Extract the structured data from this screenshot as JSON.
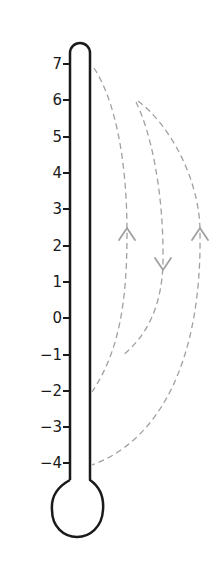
{
  "diagram": {
    "type": "thermometer",
    "scale": {
      "ticks": [
        "7",
        "6",
        "5",
        "4",
        "3",
        "2",
        "1",
        "0",
        "−1",
        "−2",
        "−3",
        "−4"
      ],
      "values": [
        7,
        6,
        5,
        4,
        3,
        2,
        1,
        0,
        -1,
        -2,
        -3,
        -4
      ]
    },
    "arrows": [
      {
        "name": "arc-7-to-minus2",
        "from": 7,
        "to": -2,
        "arrow_direction": "up",
        "style": "dashed"
      },
      {
        "name": "arc-inner-down",
        "from": 6,
        "to": -1,
        "arrow_direction": "down",
        "style": "dashed"
      },
      {
        "name": "arc-outer-minus4",
        "from": 6,
        "to": -4,
        "arrow_direction": "up",
        "style": "dashed"
      }
    ],
    "colors": {
      "outline": "#1a1a1a",
      "dashed": "#a0a0a0"
    }
  }
}
